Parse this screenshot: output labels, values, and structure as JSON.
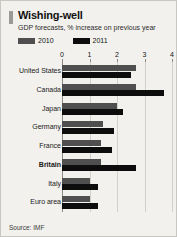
{
  "card": {
    "title": "Wishing-well",
    "subtitle": "GDP forecasts, % increase on previous year",
    "source": "Source: IMF",
    "accent_color": "#9a9a96",
    "background_color": "#f2f1ed"
  },
  "legend": {
    "items": [
      {
        "label": "2010",
        "color": "#4f4f4f"
      },
      {
        "label": "2011",
        "color": "#0d0d0d"
      }
    ]
  },
  "chart_data": {
    "type": "bar",
    "orientation": "horizontal",
    "title": "Wishing-well",
    "subtitle": "GDP forecasts, % increase on previous year",
    "xlabel": "",
    "ylabel": "",
    "xlim": [
      0,
      4
    ],
    "xticks": [
      0,
      1,
      2,
      3,
      4
    ],
    "xtick_labels": [
      "0",
      "1",
      "2",
      "3",
      "4"
    ],
    "grid": true,
    "legend_position": "top-left",
    "source": "Source: IMF",
    "categories": [
      "United States",
      "Canada",
      "Japan",
      "Germany",
      "France",
      "Britain",
      "Italy",
      "Euro area"
    ],
    "highlight_category": "Britain",
    "series": [
      {
        "name": "2010",
        "color": "#4f4f4f",
        "values": [
          2.7,
          2.7,
          2.0,
          1.5,
          1.4,
          1.4,
          1.0,
          1.0
        ]
      },
      {
        "name": "2011",
        "color": "#0d0d0d",
        "values": [
          2.5,
          3.7,
          2.2,
          1.9,
          1.8,
          2.7,
          1.3,
          1.3
        ]
      }
    ]
  }
}
